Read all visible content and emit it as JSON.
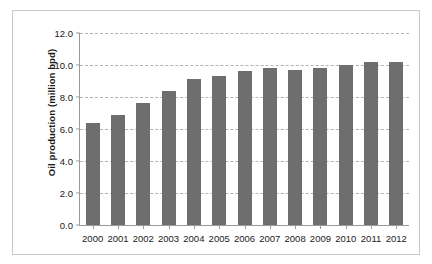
{
  "chart_data": {
    "type": "bar",
    "title": "",
    "xlabel": "",
    "ylabel": "Oil production (million bpd)",
    "categories": [
      "2000",
      "2001",
      "2002",
      "2003",
      "2004",
      "2005",
      "2006",
      "2007",
      "2008",
      "2009",
      "2010",
      "2011",
      "2012"
    ],
    "values": [
      6.4,
      6.9,
      7.6,
      8.4,
      9.1,
      9.3,
      9.6,
      9.8,
      9.7,
      9.8,
      10.0,
      10.2,
      10.2
    ],
    "series": [
      {
        "name": "Oil production",
        "values": [
          6.4,
          6.9,
          7.6,
          8.4,
          9.1,
          9.3,
          9.6,
          9.8,
          9.7,
          9.8,
          10.0,
          10.2,
          10.2
        ]
      }
    ],
    "ylim": [
      0.0,
      12.0
    ],
    "ytick_labels": [
      "0.0",
      "2.0",
      "4.0",
      "6.0",
      "8.0",
      "10.0",
      "12.0"
    ],
    "ytick_values": [
      0.0,
      2.0,
      4.0,
      6.0,
      8.0,
      10.0,
      12.0
    ],
    "ytick_interval": 2.0,
    "grid": true,
    "grid_axis": "y",
    "grid_style": "dashed",
    "legend": false,
    "legend_position": "none",
    "bar_color": "#6e6e6e",
    "grid_color": "#b4b4b4",
    "axis_color": "#9a9a9a",
    "frame_color": "#c9c9c9",
    "background_color": "#ffffff",
    "text_color": "#1a1a1a"
  }
}
